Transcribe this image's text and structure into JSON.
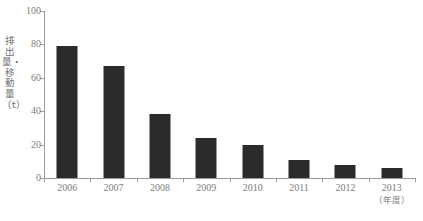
{
  "chart_data": {
    "type": "bar",
    "title": "",
    "subtitle": "",
    "xlabel": "年度",
    "ylabel": "排出量・移動量（t）",
    "categories": [
      "2006",
      "2007",
      "2008",
      "2009",
      "2010",
      "2011",
      "2012",
      "2013"
    ],
    "values": [
      79,
      67,
      38.5,
      24,
      20,
      11,
      8,
      6
    ],
    "series": [
      {
        "name": "排出量・移動量",
        "values": [
          79,
          67,
          38.5,
          24,
          20,
          11,
          8,
          6
        ]
      }
    ],
    "ylim": [
      0,
      100
    ],
    "y_ticks": [
      0,
      20,
      40,
      60,
      80,
      100
    ],
    "y_tick_labels": [
      "0",
      "20",
      "40",
      "60",
      "80",
      "100"
    ],
    "grid": false,
    "legend": false,
    "legend_position": "none",
    "bar_color": "#2b2b2b",
    "axis_color": "#9a9a9a",
    "text_color": "#7d7d7d",
    "background_color": "#ffffff",
    "annotations": []
  },
  "axes": {
    "y_title_vertical": "排出量・移動量（t）",
    "x_unit_note": "（年度）"
  },
  "x_labels": [
    {
      "label": "2006",
      "sub": ""
    },
    {
      "label": "2007",
      "sub": ""
    },
    {
      "label": "2008",
      "sub": ""
    },
    {
      "label": "2009",
      "sub": ""
    },
    {
      "label": "2010",
      "sub": ""
    },
    {
      "label": "2011",
      "sub": ""
    },
    {
      "label": "2012",
      "sub": ""
    },
    {
      "label": "2013",
      "sub": "（年度）"
    }
  ]
}
